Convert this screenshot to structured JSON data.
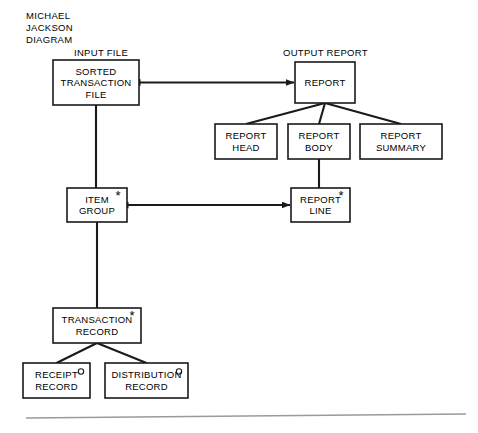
{
  "figure": {
    "title_lines": [
      "MICHAEL",
      "JACKSON",
      "DIAGRAM"
    ],
    "section_labels": {
      "input": "INPUT FILE",
      "output": "OUTPUT REPORT"
    },
    "markers": {
      "iteration": "*",
      "selection": "o"
    },
    "colors": {
      "stroke": "#1a1a1a",
      "background": "#ffffff",
      "rule": "#9a9a9a"
    }
  },
  "nodes": [
    {
      "id": "sorted-transaction-file",
      "lines": [
        "SORTED",
        "TRANSACTION",
        "FILE"
      ],
      "marker": "none",
      "x": 53,
      "y": 60,
      "w": 86,
      "h": 45
    },
    {
      "id": "report",
      "lines": [
        "REPORT"
      ],
      "marker": "none",
      "x": 295,
      "y": 62,
      "w": 60,
      "h": 41
    },
    {
      "id": "report-head",
      "lines": [
        "REPORT",
        "HEAD"
      ],
      "marker": "none",
      "x": 215,
      "y": 124,
      "w": 62,
      "h": 35
    },
    {
      "id": "report-body",
      "lines": [
        "REPORT",
        "BODY"
      ],
      "marker": "none",
      "x": 288,
      "y": 124,
      "w": 62,
      "h": 35
    },
    {
      "id": "report-summary",
      "lines": [
        "REPORT",
        "SUMMARY"
      ],
      "marker": "none",
      "x": 360,
      "y": 124,
      "w": 82,
      "h": 35
    },
    {
      "id": "item-group",
      "lines": [
        "ITEM",
        "GROUP"
      ],
      "marker": "iteration",
      "x": 67,
      "y": 188,
      "w": 60,
      "h": 34
    },
    {
      "id": "report-line",
      "lines": [
        "REPORT",
        "LINE"
      ],
      "marker": "iteration",
      "x": 291,
      "y": 188,
      "w": 59,
      "h": 34
    },
    {
      "id": "transaction-record",
      "lines": [
        "TRANSACTION",
        "RECORD"
      ],
      "marker": "iteration",
      "x": 53,
      "y": 308,
      "w": 88,
      "h": 35
    },
    {
      "id": "receipt-record",
      "lines": [
        "RECEIPT",
        "RECORD"
      ],
      "marker": "selection",
      "x": 23,
      "y": 363,
      "w": 67,
      "h": 35
    },
    {
      "id": "distribution-record",
      "lines": [
        "DISTRIBUTION",
        "RECORD"
      ],
      "marker": "selection",
      "x": 105,
      "y": 363,
      "w": 83,
      "h": 35
    }
  ],
  "connections": [
    {
      "id": "file-to-report",
      "kind": "double-arrow",
      "from": "sorted-transaction-file",
      "to": "report"
    },
    {
      "id": "report-to-head",
      "kind": "tree",
      "from": "report",
      "to": "report-head"
    },
    {
      "id": "report-to-body",
      "kind": "tree",
      "from": "report",
      "to": "report-body"
    },
    {
      "id": "report-to-summary",
      "kind": "tree",
      "from": "report",
      "to": "report-summary"
    },
    {
      "id": "file-to-item-group",
      "kind": "vertical",
      "from": "sorted-transaction-file",
      "to": "item-group"
    },
    {
      "id": "body-to-report-line",
      "kind": "vertical",
      "from": "report-body",
      "to": "report-line"
    },
    {
      "id": "item-group-to-report-line",
      "kind": "double-arrow",
      "from": "item-group",
      "to": "report-line"
    },
    {
      "id": "item-group-to-transaction-record",
      "kind": "vertical",
      "from": "item-group",
      "to": "transaction-record"
    },
    {
      "id": "transaction-to-receipt",
      "kind": "tree",
      "from": "transaction-record",
      "to": "receipt-record"
    },
    {
      "id": "transaction-to-distribution",
      "kind": "tree",
      "from": "transaction-record",
      "to": "distribution-record"
    }
  ],
  "footer_rule": {
    "x1": 26,
    "y1": 418,
    "x2": 466,
    "y2": 414
  }
}
